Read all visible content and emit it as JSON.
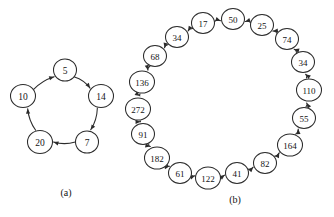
{
  "figure": {
    "background_color": "#ffffff",
    "ink_color": "#2b2b2b",
    "panels": [
      {
        "id": "panel-a",
        "caption": "(a)",
        "caption_x": 66,
        "caption_y": 192,
        "center_x": 65,
        "center_y": 107,
        "radius": 38,
        "node_radius": 11.5,
        "start_angle_deg": -90,
        "direction": "clockwise",
        "node_font_size": 9.5,
        "nodes": [
          {
            "label": "5",
            "cx": 65,
            "cy": 70,
            "rx": 11.5,
            "ry": 11.0
          },
          {
            "label": "14",
            "cx": 101,
            "cy": 96,
            "rx": 12.5,
            "ry": 11.5
          },
          {
            "label": "7",
            "cx": 87,
            "cy": 142,
            "rx": 11.5,
            "ry": 11.0
          },
          {
            "label": "20",
            "cx": 40,
            "cy": 142,
            "rx": 12.5,
            "ry": 11.5
          },
          {
            "label": "10",
            "cx": 23,
            "cy": 96,
            "rx": 12.5,
            "ry": 11.5
          }
        ],
        "edges": [
          {
            "from": "5",
            "to": "14"
          },
          {
            "from": "14",
            "to": "7"
          },
          {
            "from": "7",
            "to": "20"
          },
          {
            "from": "20",
            "to": "10"
          },
          {
            "from": "10",
            "to": "5"
          }
        ]
      },
      {
        "id": "panel-b",
        "caption": "(b)",
        "caption_x": 235,
        "caption_y": 199,
        "center_x": 235,
        "center_y": 97,
        "radius": 75,
        "node_radius": 11.5,
        "node_font_size": 9,
        "nodes": [
          {
            "label": "50",
            "cx": 233,
            "cy": 19,
            "rx": 11.5,
            "ry": 10.5
          },
          {
            "label": "25",
            "cx": 262,
            "cy": 25,
            "rx": 11.5,
            "ry": 10.5
          },
          {
            "label": "74",
            "cx": 287,
            "cy": 39,
            "rx": 11.5,
            "ry": 10.5
          },
          {
            "label": "34",
            "cx": 303,
            "cy": 62,
            "rx": 11.5,
            "ry": 10.5
          },
          {
            "label": "110",
            "cx": 309,
            "cy": 90,
            "rx": 12.5,
            "ry": 11.0
          },
          {
            "label": "55",
            "cx": 304,
            "cy": 118,
            "rx": 11.5,
            "ry": 10.5
          },
          {
            "label": "164",
            "cx": 290,
            "cy": 145,
            "rx": 12.5,
            "ry": 11.0
          },
          {
            "label": "82",
            "cx": 265,
            "cy": 163,
            "rx": 11.5,
            "ry": 10.5
          },
          {
            "label": "41",
            "cx": 237,
            "cy": 173,
            "rx": 11.5,
            "ry": 10.5
          },
          {
            "label": "122",
            "cx": 208,
            "cy": 178,
            "rx": 12.5,
            "ry": 11.0
          },
          {
            "label": "61",
            "cx": 180,
            "cy": 173,
            "rx": 11.5,
            "ry": 10.5
          },
          {
            "label": "182",
            "cx": 157,
            "cy": 158,
            "rx": 12.5,
            "ry": 11.0
          },
          {
            "label": "91",
            "cx": 143,
            "cy": 134,
            "rx": 11.5,
            "ry": 10.5
          },
          {
            "label": "272",
            "cx": 138,
            "cy": 109,
            "rx": 12.5,
            "ry": 11.0
          },
          {
            "label": "136",
            "cx": 142,
            "cy": 82,
            "rx": 12.5,
            "ry": 11.0
          },
          {
            "label": "68",
            "cx": 155,
            "cy": 56,
            "rx": 11.5,
            "ry": 10.5
          },
          {
            "label": "34",
            "cx": 177,
            "cy": 37,
            "rx": 11.5,
            "ry": 10.5
          },
          {
            "label": "17",
            "cx": 203,
            "cy": 23,
            "rx": 11.5,
            "ry": 10.5
          }
        ],
        "edges": [
          {
            "from": "17",
            "to": "50"
          },
          {
            "from": "25",
            "to": "50"
          },
          {
            "from": "74",
            "to": "25"
          },
          {
            "from": "34",
            "to": "74"
          },
          {
            "from": "110",
            "to": "34"
          },
          {
            "from": "55",
            "to": "110"
          },
          {
            "from": "164",
            "to": "55"
          },
          {
            "from": "82",
            "to": "164"
          },
          {
            "from": "41",
            "to": "82"
          },
          {
            "from": "122",
            "to": "41"
          },
          {
            "from": "61",
            "to": "122"
          },
          {
            "from": "182",
            "to": "61"
          },
          {
            "from": "91",
            "to": "182"
          },
          {
            "from": "272",
            "to": "91"
          },
          {
            "from": "136",
            "to": "272"
          },
          {
            "from": "68",
            "to": "136"
          },
          {
            "from": "34b",
            "to": "68"
          },
          {
            "from": "17",
            "to": "34b"
          }
        ]
      }
    ]
  }
}
